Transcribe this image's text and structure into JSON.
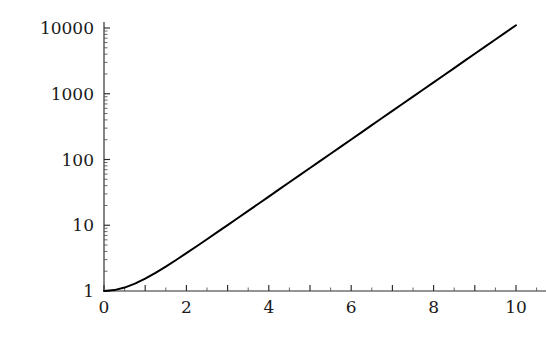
{
  "figure": {
    "background_color": "#ffffff",
    "curve_color": "#000000",
    "axis_color": "#2a2a2a"
  },
  "chart_data": {
    "type": "line",
    "title": "",
    "subtitle": "",
    "xlabel": "",
    "ylabel": "",
    "yscale": "log",
    "xscale": "linear",
    "grid": false,
    "legend": false,
    "legend_position": "none",
    "xlim": [
      0,
      10
    ],
    "ylim": [
      1,
      20000
    ],
    "x_tick_labels": [
      "0",
      "2",
      "4",
      "6",
      "8",
      "10"
    ],
    "x_tick_values": [
      0,
      2,
      4,
      6,
      8,
      10
    ],
    "x_minor_tick_step": 0.5,
    "y_tick_labels": [
      "1",
      "10",
      "100",
      "1000",
      "10000"
    ],
    "y_tick_values": [
      1,
      10,
      100,
      1000,
      10000
    ],
    "series": [
      {
        "name": "cosh(x)",
        "x": [
          0,
          0.25,
          0.5,
          0.75,
          1,
          1.25,
          1.5,
          1.75,
          2,
          2.25,
          2.5,
          2.75,
          3,
          3.25,
          3.5,
          3.75,
          4,
          4.25,
          4.5,
          4.75,
          5,
          5.25,
          5.5,
          5.75,
          6,
          6.25,
          6.5,
          6.75,
          7,
          7.25,
          7.5,
          7.75,
          8,
          8.25,
          8.5,
          8.75,
          9,
          9.25,
          9.5,
          9.75,
          10
        ],
        "y": [
          1,
          1.0314,
          1.1276,
          1.2947,
          1.5431,
          1.8884,
          2.3524,
          2.9642,
          3.7622,
          4.7967,
          6.1323,
          7.8533,
          10.068,
          12.915,
          16.573,
          21.272,
          27.308,
          35.06,
          45.014,
          57.796,
          74.21,
          95.29,
          122.35,
          157.09,
          201.72,
          259.0,
          332.57,
          427.03,
          548.32,
          704.08,
          904.02,
          1160.7,
          1490.5,
          1913.9,
          2457.4,
          3155.4,
          4051.5,
          5202.3,
          6679.9,
          8577.0,
          11013.2
        ]
      }
    ],
    "annotations": []
  }
}
